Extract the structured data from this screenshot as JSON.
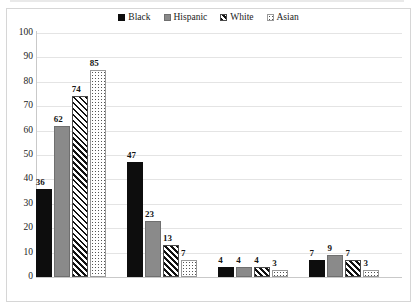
{
  "chart_data": {
    "type": "bar",
    "title": "",
    "subtitle": "",
    "xlabel": "",
    "ylabel": "",
    "ylim": [
      0,
      100
    ],
    "ytick_step": 10,
    "yticks": [
      100,
      90,
      80,
      70,
      60,
      50,
      40,
      30,
      20,
      10,
      0
    ],
    "grid": true,
    "legend_position": "top-center",
    "categories": [
      "Married parents",
      "Solo mother",
      "Solo father",
      "Cohabiting parents"
    ],
    "series": [
      {
        "name": "Black",
        "values": [
          36,
          47,
          4,
          7
        ],
        "swatch": "solid-black",
        "color": "#0d0d0d"
      },
      {
        "name": "Hispanic",
        "values": [
          62,
          23,
          4,
          9
        ],
        "swatch": "solid-gray",
        "color": "#8a8a8a"
      },
      {
        "name": "White",
        "values": [
          74,
          13,
          4,
          7
        ],
        "swatch": "diagonal-hatch",
        "color": "#111111"
      },
      {
        "name": "Asian",
        "values": [
          85,
          7,
          3,
          3
        ],
        "swatch": "dotted",
        "color": "#ffffff"
      }
    ],
    "data_labels": true,
    "annotations": []
  },
  "colors": {
    "background": "#ffffff",
    "border": "#d6d6d6",
    "gridline": "#e4e4e4",
    "axis_line": "#c9c9c9",
    "text": "#222222",
    "label_text": "#151515"
  }
}
